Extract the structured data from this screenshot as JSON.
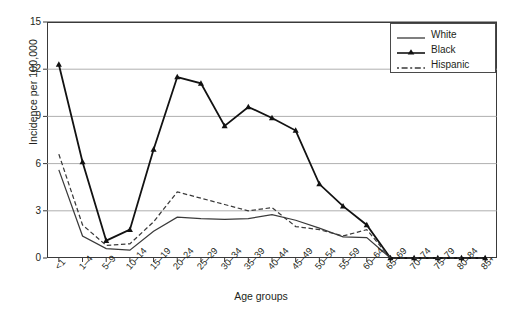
{
  "chart_data": {
    "type": "line",
    "title": "",
    "xlabel": "Age groups",
    "ylabel": "Incidence per 100,000",
    "ylim": [
      0,
      15
    ],
    "yticks": [
      0,
      3,
      6,
      9,
      12,
      15
    ],
    "grid": true,
    "legend_position": "top-right",
    "categories": [
      "<1",
      "1–4",
      "5–9",
      "10–14",
      "15–19",
      "20–24",
      "25–29",
      "30–34",
      "35–39",
      "40–44",
      "45–49",
      "50–54",
      "55–59",
      "60–64",
      "65–69",
      "70–74",
      "75–79",
      "80–84",
      "85+"
    ],
    "series": [
      {
        "name": "White",
        "style": "solid",
        "marker": "none",
        "color": "#3a3a3a",
        "values": [
          5.6,
          1.4,
          0.6,
          0.5,
          1.7,
          2.6,
          2.5,
          2.45,
          2.5,
          2.75,
          2.4,
          1.9,
          1.35,
          1.3,
          0,
          0,
          0,
          0,
          0
        ]
      },
      {
        "name": "Black",
        "style": "solid",
        "marker": "triangle",
        "color": "#121212",
        "values": [
          12.3,
          6.1,
          1.1,
          1.8,
          6.9,
          11.5,
          11.1,
          8.4,
          9.6,
          8.9,
          8.1,
          4.7,
          3.3,
          2.1,
          0,
          0,
          0,
          0,
          0
        ]
      },
      {
        "name": "Hispanic",
        "style": "dashed",
        "marker": "none",
        "color": "#3a3a3a",
        "values": [
          6.6,
          2.1,
          0.8,
          0.9,
          2.3,
          4.2,
          3.8,
          3.4,
          3.0,
          3.2,
          2.0,
          1.8,
          1.4,
          1.8,
          0,
          0,
          0,
          0,
          0
        ]
      }
    ]
  },
  "legend": {
    "items": [
      {
        "label": "White"
      },
      {
        "label": "Black"
      },
      {
        "label": "Hispanic"
      }
    ]
  },
  "axes": {
    "y_title": "Incidence per 100,000",
    "x_title": "Age groups"
  }
}
